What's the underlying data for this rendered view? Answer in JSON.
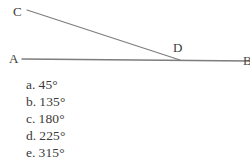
{
  "figure": {
    "type": "geometry-diagram",
    "stroke_color": "#7d7d7d",
    "label_color": "#3b3b3b",
    "background_color": "#ffffff",
    "points": [
      {
        "name": "C",
        "label": "C",
        "x": 27,
        "y": 10
      },
      {
        "name": "A",
        "label": "A",
        "x": 22,
        "y": 59
      },
      {
        "name": "D",
        "label": "D",
        "x": 179,
        "y": 59
      },
      {
        "name": "B",
        "label": "B",
        "x": 248,
        "y": 61
      }
    ],
    "segments": [
      {
        "name": "line-AB",
        "from": "A",
        "to": "B",
        "x1": 22,
        "y1": 59,
        "x2": 250,
        "y2": 61
      },
      {
        "name": "ray-CD",
        "from": "C",
        "to": "D",
        "x1": 27,
        "y1": 10,
        "x2": 180,
        "y2": 60
      }
    ]
  },
  "choices": [
    {
      "letter": "a.",
      "value": "45°"
    },
    {
      "letter": "b.",
      "value": "135°"
    },
    {
      "letter": "c.",
      "value": "180°"
    },
    {
      "letter": "d.",
      "value": "225°"
    },
    {
      "letter": "e.",
      "value": "315°"
    }
  ]
}
